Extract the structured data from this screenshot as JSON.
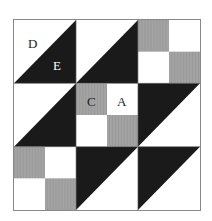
{
  "diagram": {
    "type": "quilt-block-pattern",
    "grid": {
      "rows": 3,
      "cols": 3
    },
    "colors": {
      "dark": "#1a1a1a",
      "gray": "#a3a3a3",
      "light": "#ffffff",
      "border": "#888888"
    },
    "blocks": [
      {
        "row": 0,
        "col": 0,
        "kind": "half-square-triangle",
        "dark": "lower-right"
      },
      {
        "row": 0,
        "col": 1,
        "kind": "half-square-triangle",
        "dark": "lower-right"
      },
      {
        "row": 0,
        "col": 2,
        "kind": "four-patch",
        "gray": [
          "top-left",
          "bottom-right"
        ]
      },
      {
        "row": 1,
        "col": 0,
        "kind": "half-square-triangle",
        "dark": "lower-right"
      },
      {
        "row": 1,
        "col": 1,
        "kind": "four-patch",
        "gray": [
          "top-left",
          "bottom-right"
        ]
      },
      {
        "row": 1,
        "col": 2,
        "kind": "half-square-triangle",
        "dark": "upper-left"
      },
      {
        "row": 2,
        "col": 0,
        "kind": "four-patch",
        "gray": [
          "top-left",
          "bottom-right"
        ]
      },
      {
        "row": 2,
        "col": 1,
        "kind": "half-square-triangle",
        "dark": "upper-left"
      },
      {
        "row": 2,
        "col": 2,
        "kind": "half-square-triangle",
        "dark": "upper-left"
      }
    ],
    "labels": {
      "D": "D",
      "E": "E",
      "C": "C",
      "A": "A"
    }
  }
}
